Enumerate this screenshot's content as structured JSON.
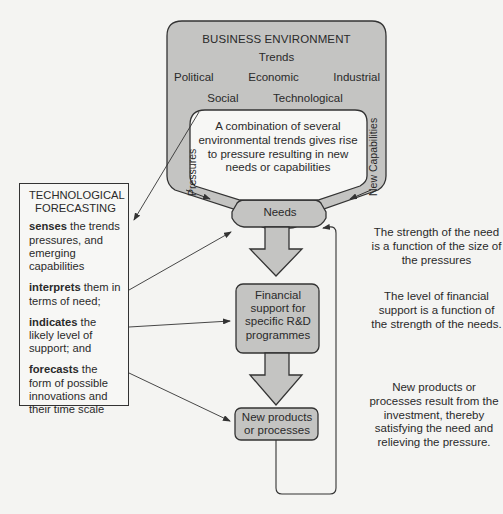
{
  "environment": {
    "title": "BUSINESS ENVIRONMENT",
    "subtitle": "Trends",
    "trends_row1": [
      "Political",
      "Economic",
      "Industrial"
    ],
    "trends_row2": [
      "Social",
      "Technological"
    ],
    "inner_text": "A combination of several environmental trends gives rise to pressure resulting in new needs or capabilities",
    "left_channel_label": "Pressures",
    "right_channel_label": "New Capabilities"
  },
  "flow": {
    "needs": "Needs",
    "financial_support": "Financial support for specific R&D programmes",
    "new_products": "New products or processes"
  },
  "forecasting": {
    "title": "TECHNOLOGICAL FORECASTING",
    "items": [
      {
        "verb": "senses",
        "rest": " the trends pressures, and emerging capabilities"
      },
      {
        "verb": "interprets",
        "rest": " them in terms of need;"
      },
      {
        "verb": "indicates",
        "rest": " the likely level of support; and"
      },
      {
        "verb": "forecasts",
        "rest": " the form of possible innovations and their time scale"
      }
    ]
  },
  "notes": {
    "needs_note": "The strength of the need is a function of the size of the pressures",
    "support_note": "The level of financial support is a function of the strength of the needs.",
    "products_note": "New products or processes result from the investment, thereby satisfying the need and relieving the pressure."
  },
  "colors": {
    "shape_fill": "#c4c4c2",
    "inner_fill": "#f7f7f5",
    "stroke": "#333333",
    "background": "#f4f4f2"
  }
}
